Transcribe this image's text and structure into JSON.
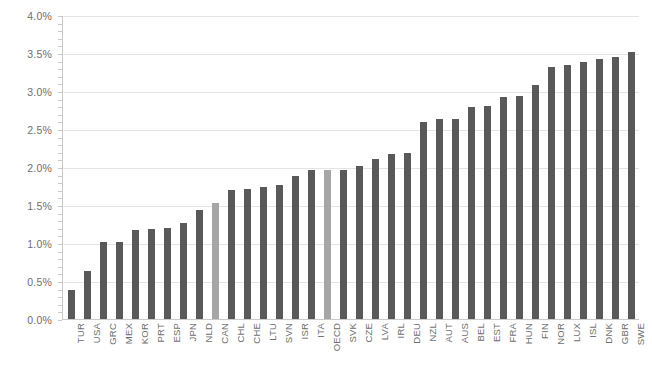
{
  "chart_data": {
    "type": "bar",
    "title": "",
    "xlabel": "",
    "ylabel": "",
    "ylim": [
      0.0,
      4.0
    ],
    "ytick_labels": [
      "0.0%",
      "0.5%",
      "1.0%",
      "1.5%",
      "2.0%",
      "2.5%",
      "3.0%",
      "3.5%",
      "4.0%"
    ],
    "ytick_values": [
      0.0,
      0.5,
      1.0,
      1.5,
      2.0,
      2.5,
      3.0,
      3.5,
      4.0
    ],
    "grid": true,
    "legend": "none",
    "bar_color": "#595959",
    "highlight_color": "#a6a6a6",
    "highlight_categories": [
      "CAN",
      "OECD"
    ],
    "categories": [
      "TUR",
      "USA",
      "GRC",
      "MEX",
      "KOR",
      "PRT",
      "ESP",
      "JPN",
      "NLD",
      "CAN",
      "CHL",
      "CHE",
      "LTU",
      "SVN",
      "ISR",
      "ITA",
      "OECD",
      "SVK",
      "CZE",
      "LVA",
      "IRL",
      "DEU",
      "NZL",
      "AUT",
      "AUS",
      "BEL",
      "EST",
      "FRA",
      "HUN",
      "FIN",
      "NOR",
      "LUX",
      "ISL",
      "DNK",
      "GBR",
      "SWE"
    ],
    "values": [
      0.4,
      0.65,
      1.03,
      1.02,
      1.19,
      1.2,
      1.21,
      1.28,
      1.45,
      1.54,
      1.71,
      1.72,
      1.75,
      1.78,
      1.9,
      1.97,
      1.97,
      1.97,
      2.02,
      2.12,
      2.19,
      2.2,
      2.6,
      2.64,
      2.65,
      2.8,
      2.81,
      2.94,
      2.95,
      3.09,
      3.33,
      3.35,
      3.4,
      3.43,
      3.46,
      3.52
    ]
  }
}
